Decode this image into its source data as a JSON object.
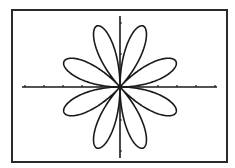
{
  "chart_data": {
    "type": "line",
    "subtype": "polar",
    "title": "",
    "equation": "r = sin(4θ)",
    "petals": 8,
    "amplitude": 1,
    "theta_range": [
      0,
      6.283185
    ],
    "xlabel": "",
    "ylabel": "",
    "xlim": [
      -1.5,
      1.5
    ],
    "ylim": [
      -1.0,
      1.0
    ],
    "grid": false,
    "legend": null,
    "axes": {
      "x_ticks_left": 5,
      "x_ticks_right": 5,
      "y_ticks_up": 2,
      "y_ticks_down": 2
    },
    "petal_angles_deg": [
      22.5,
      67.5,
      112.5,
      157.5,
      202.5,
      247.5,
      292.5,
      337.5
    ]
  },
  "colors": {
    "background": "#ffffff",
    "frame": "#2a2a2a",
    "ink": "#1a1a1a"
  },
  "layout": {
    "origin_px": [
      120,
      87
    ],
    "petal_radius_px": 66,
    "x_axis_px": [
      22,
      217
    ],
    "y_axis_px": [
      16,
      158
    ],
    "x_tick_spacing_px": 19,
    "y_tick_spacing_px": 31
  }
}
